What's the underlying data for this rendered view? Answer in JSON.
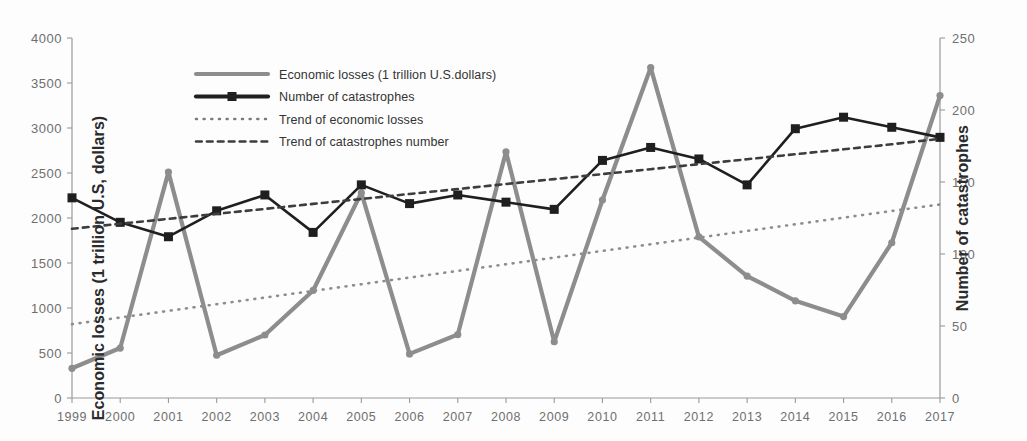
{
  "chart_data": {
    "type": "line",
    "title": "",
    "xlabel": "",
    "categories": [
      "1999",
      "2000",
      "2001",
      "2002",
      "2003",
      "2004",
      "2005",
      "2006",
      "2007",
      "2008",
      "2009",
      "2010",
      "2011",
      "2012",
      "2013",
      "2014",
      "2015",
      "2016",
      "2017"
    ],
    "grid": false,
    "legend_position": "top-center",
    "axes": {
      "left": {
        "label": "Economic losses (1 trillion U.S, dollars)",
        "min": 0,
        "max": 4000,
        "step": 500,
        "ticks": [
          "0",
          "500",
          "1000",
          "1500",
          "2000",
          "2500",
          "3000",
          "3500",
          "4000"
        ]
      },
      "right": {
        "label": "Number of catastrophes",
        "min": 0,
        "max": 250,
        "step": 50,
        "ticks": [
          "0",
          "50",
          "100",
          "150",
          "200",
          "250"
        ]
      }
    },
    "series": [
      {
        "name": "Economic losses (1 trillion U.S.dollars)",
        "axis": "left",
        "style": "solid",
        "color": "#8d8d8d",
        "marker": "circle",
        "values": [
          330,
          555,
          2510,
          475,
          700,
          1195,
          2280,
          490,
          705,
          2735,
          625,
          2200,
          3670,
          1790,
          1355,
          1080,
          905,
          1725,
          3360
        ]
      },
      {
        "name": "Number of catastrophes",
        "axis": "right",
        "style": "solid",
        "color": "#1f1f1f",
        "marker": "square",
        "values": [
          139,
          122,
          112,
          130,
          141,
          115,
          148,
          135,
          141,
          136,
          131,
          165,
          174,
          166,
          148,
          187,
          195,
          188,
          181
        ]
      },
      {
        "name": "Trend of economic losses",
        "axis": "left",
        "style": "dotted",
        "color": "#8d8d8d",
        "marker": "none",
        "values": [
          820,
          894,
          968,
          1042,
          1116,
          1190,
          1264,
          1338,
          1412,
          1486,
          1560,
          1634,
          1708,
          1782,
          1856,
          1930,
          2004,
          2078,
          2150
        ]
      },
      {
        "name": "Trend of catastrophes number",
        "axis": "right",
        "style": "dashed",
        "color": "#3d3d3d",
        "marker": "none",
        "values": [
          117.5,
          121.0,
          124.4,
          127.9,
          131.3,
          134.8,
          138.2,
          141.7,
          145.1,
          148.6,
          152.0,
          155.5,
          158.9,
          162.4,
          165.8,
          169.3,
          172.7,
          176.2,
          180.0
        ]
      }
    ]
  },
  "legend": {
    "items": [
      {
        "label": "Economic losses (1 trillion U.S.dollars)",
        "style": "solid",
        "color": "#8d8d8d",
        "marker": "none"
      },
      {
        "label": "Number of catastrophes",
        "style": "solid",
        "color": "#1f1f1f",
        "marker": "square"
      },
      {
        "label": "Trend of economic losses",
        "style": "dotted",
        "color": "#7a7a7a",
        "marker": "none"
      },
      {
        "label": "Trend of catastrophes number",
        "style": "dashed",
        "color": "#3d3d3d",
        "marker": "none"
      }
    ]
  },
  "background_artifacts": {
    "bleed_line_1": "",
    "bleed_line_2": "",
    "ghost_text": ""
  }
}
